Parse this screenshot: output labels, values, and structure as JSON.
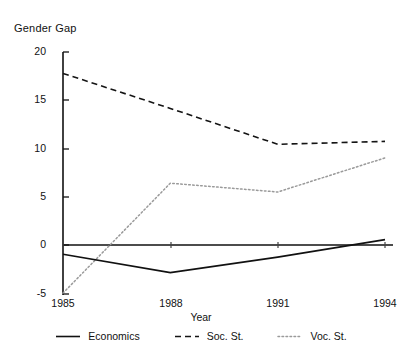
{
  "chart_data": {
    "type": "line",
    "title": "Gender Gap",
    "xlabel": "Year",
    "ylabel": "Gender Gap",
    "x": [
      1985,
      1988,
      1991,
      1994
    ],
    "xtick_labels": [
      "1985",
      "1988",
      "1991",
      "1994"
    ],
    "ytick_labels": [
      "20",
      "15",
      "10",
      "5",
      "0",
      "-5"
    ],
    "ytick_values": [
      20,
      15,
      10,
      5,
      0,
      -5
    ],
    "xlim": [
      1985,
      1994
    ],
    "ylim": [
      -5,
      20
    ],
    "grid": false,
    "legend_position": "below",
    "zero_line": true,
    "series": [
      {
        "name": "Economics",
        "style": "solid",
        "color": "#111111",
        "values": [
          -0.8,
          -2.7,
          -1.1,
          0.7
        ]
      },
      {
        "name": "Soc. St.",
        "style": "dashed",
        "color": "#111111",
        "values": [
          17.8,
          14.2,
          10.5,
          10.8
        ]
      },
      {
        "name": "Voc. St.",
        "style": "dotted",
        "color": "#999999",
        "values": [
          -4.8,
          6.5,
          5.6,
          9.1
        ]
      }
    ]
  },
  "title": {
    "text": "Gender Gap"
  },
  "axes": {
    "x_title": "Year",
    "x_ticks": [
      "1985",
      "1988",
      "1991",
      "1994"
    ],
    "y_ticks": [
      "20",
      "15",
      "10",
      "5",
      "0",
      "-5"
    ]
  },
  "legend": {
    "items": [
      {
        "label": "Economics",
        "style": "solid"
      },
      {
        "label": "Soc. St.",
        "style": "dashed"
      },
      {
        "label": "Voc. St.",
        "style": "dotted"
      }
    ]
  }
}
